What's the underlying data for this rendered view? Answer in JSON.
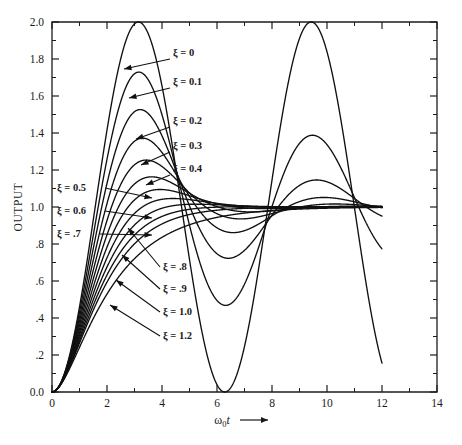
{
  "chart_data": {
    "type": "line",
    "title": "",
    "subtitle": "",
    "xlabel": "ω₀t",
    "xlabel_suffix": "⟶",
    "ylabel": "OUTPUT",
    "xlim": [
      0,
      14
    ],
    "ylim": [
      0.0,
      2.0
    ],
    "grid": false,
    "legend_position": "inline-annotations",
    "x_major_ticks": [
      0,
      2,
      4,
      6,
      8,
      10,
      12,
      14
    ],
    "x_major_tick_labels": [
      "0",
      "2",
      "4",
      "6",
      "8",
      "10",
      "12",
      "14"
    ],
    "x_minor_tick_step": 1,
    "y_major_ticks": [
      0.0,
      0.2,
      0.4,
      0.6,
      0.8,
      1.0,
      1.2,
      1.4,
      1.6,
      1.8,
      2.0
    ],
    "y_major_tick_labels": [
      "0.0",
      ".2",
      ".4",
      ".6",
      ".8",
      "1.0",
      "1.2",
      "1.4",
      "1.6",
      "1.8",
      "2.0"
    ],
    "y_minor_tick_step": 0.1,
    "formula": "y = 1 - exp(-z*x)*(cos(sqrt(1-z*z)*x) + z/sqrt(1-z*z)*sin(sqrt(1-z*z)*x))",
    "series": [
      {
        "name": "ξ = 0",
        "zeta": 0.0,
        "x_end": 12.0,
        "first_peak": {
          "x": 3.14,
          "y": 2.0
        },
        "first_trough": {
          "x": 6.28,
          "y": 0.0
        },
        "second_peak": {
          "x": 9.42,
          "y": 2.0
        },
        "end_value": 0.15
      },
      {
        "name": "ξ = 0.1",
        "zeta": 0.1,
        "x_end": 12.0,
        "first_peak": {
          "x": 3.16,
          "y": 1.73
        },
        "first_trough": {
          "x": 6.31,
          "y": 0.46
        },
        "second_peak": {
          "x": 9.47,
          "y": 1.39
        },
        "end_value": 0.76
      },
      {
        "name": "ξ = 0.2",
        "zeta": 0.2,
        "x_end": 12.0,
        "first_peak": {
          "x": 3.21,
          "y": 1.53
        },
        "first_trough": {
          "x": 6.41,
          "y": 0.73
        },
        "second_peak": {
          "x": 9.62,
          "y": 1.14
        },
        "end_value": 0.93
      },
      {
        "name": "ξ = 0.3",
        "zeta": 0.3,
        "x_end": 12.0,
        "first_peak": {
          "x": 3.29,
          "y": 1.37
        },
        "first_trough": {
          "x": 6.59,
          "y": 0.86
        },
        "second_peak": {
          "x": 9.88,
          "y": 1.05
        },
        "end_value": 0.98
      },
      {
        "name": "ξ = 0.4",
        "zeta": 0.4,
        "x_end": 12.0,
        "first_peak": {
          "x": 3.43,
          "y": 1.25
        },
        "first_trough": {
          "x": 6.86,
          "y": 0.94
        },
        "second_peak": {
          "x": 10.28,
          "y": 1.02
        },
        "end_value": 1.0
      },
      {
        "name": "ξ = 0.5",
        "zeta": 0.5,
        "x_end": 12.0,
        "first_peak": {
          "x": 3.63,
          "y": 1.16
        },
        "first_trough": {
          "x": 7.26,
          "y": 0.97
        },
        "second_peak": {
          "x": 10.88,
          "y": 1.01
        },
        "end_value": 1.0
      },
      {
        "name": "ξ = 0.6",
        "zeta": 0.6,
        "x_end": 12.0,
        "first_peak": {
          "x": 3.93,
          "y": 1.09
        },
        "first_trough": {
          "x": 7.85,
          "y": 0.99
        },
        "second_peak": {
          "x": 11.78,
          "y": 1.0
        },
        "end_value": 1.0
      },
      {
        "name": "ξ = .7",
        "zeta": 0.7,
        "x_end": 12.0,
        "first_peak": {
          "x": 4.4,
          "y": 1.05
        },
        "first_trough": {
          "x": 8.8,
          "y": 1.0
        },
        "second_peak": {
          "x": 13.19,
          "y": 1.0
        },
        "end_value": 1.0
      },
      {
        "name": "ξ = .8",
        "zeta": 0.8,
        "x_end": 12.0,
        "first_peak": {
          "x": 5.24,
          "y": 1.02
        },
        "first_trough": {
          "x": 10.47,
          "y": 1.0
        },
        "second_peak": null,
        "end_value": 1.0
      },
      {
        "name": "ξ = .9",
        "zeta": 0.9,
        "x_end": 12.0,
        "first_peak": {
          "x": 7.21,
          "y": 1.0
        },
        "first_trough": null,
        "second_peak": null,
        "end_value": 1.0
      },
      {
        "name": "ξ = 1.0",
        "zeta": 1.0,
        "x_end": 12.0,
        "first_peak": null,
        "first_trough": null,
        "second_peak": null,
        "end_value": 1.0
      },
      {
        "name": "ξ = 1.2",
        "zeta": 1.2,
        "x_end": 12.0,
        "first_peak": null,
        "first_trough": null,
        "second_peak": null,
        "end_value": 0.99
      }
    ],
    "annotations": [
      {
        "label": "ξ = 0",
        "text_x": 173,
        "text_y": 56,
        "anchor": "start",
        "leader_from": [
          170,
          59
        ],
        "leader_to": [
          124,
          69
        ]
      },
      {
        "label": "ξ = 0.1",
        "text_x": 173,
        "text_y": 85,
        "anchor": "start",
        "leader_from": [
          170,
          88
        ],
        "leader_to": [
          129,
          98
        ]
      },
      {
        "label": "ξ = 0.2",
        "text_x": 173,
        "text_y": 124,
        "anchor": "start",
        "leader_from": [
          170,
          127
        ],
        "leader_to": [
          136,
          139
        ]
      },
      {
        "label": "ξ = 0.3",
        "text_x": 173,
        "text_y": 149,
        "anchor": "start",
        "leader_from": [
          170,
          152
        ],
        "leader_to": [
          141,
          165
        ]
      },
      {
        "label": "ξ = 0.4",
        "text_x": 173,
        "text_y": 172,
        "anchor": "start",
        "leader_from": [
          170,
          175
        ],
        "leader_to": [
          146,
          185
        ]
      },
      {
        "label": "ξ = 0.5",
        "text_x": 57,
        "text_y": 191,
        "anchor": "start",
        "leader_from": [
          105,
          188
        ],
        "leader_to": [
          152,
          198
        ]
      },
      {
        "label": "ξ = 0.6",
        "text_x": 57,
        "text_y": 214,
        "anchor": "start",
        "leader_from": [
          105,
          211
        ],
        "leader_to": [
          152,
          218
        ]
      },
      {
        "label": "ξ = .7",
        "text_x": 57,
        "text_y": 237,
        "anchor": "start",
        "leader_from": [
          100,
          234
        ],
        "leader_to": [
          152,
          235
        ]
      },
      {
        "label": "ξ = .8",
        "text_x": 163,
        "text_y": 270,
        "anchor": "start",
        "leader_from": [
          160,
          267
        ],
        "leader_to": [
          128,
          228
        ]
      },
      {
        "label": "ξ = .9",
        "text_x": 163,
        "text_y": 292,
        "anchor": "start",
        "leader_from": [
          160,
          289
        ],
        "leader_to": [
          122,
          255
        ]
      },
      {
        "label": "ξ = 1.0",
        "text_x": 163,
        "text_y": 315,
        "anchor": "start",
        "leader_from": [
          160,
          312
        ],
        "leader_to": [
          116,
          280
        ]
      },
      {
        "label": "ξ = 1.2",
        "text_x": 163,
        "text_y": 339,
        "anchor": "start",
        "leader_from": [
          160,
          336
        ],
        "leader_to": [
          110,
          305
        ]
      }
    ]
  },
  "plot_area": {
    "left": 52,
    "right": 437,
    "top": 22,
    "bottom": 392
  },
  "colors": {
    "curve": "#101010",
    "axis": "#1d1d1d",
    "text": "#1a1a1a",
    "background": "#ffffff"
  }
}
